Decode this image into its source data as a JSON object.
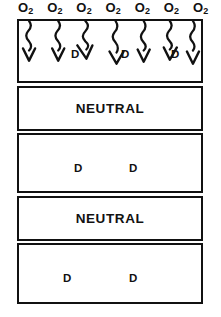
{
  "diagram": {
    "colors": {
      "ink": "#111111",
      "background": "#ffffff"
    },
    "top_species": {
      "symbol": "O",
      "subscript": "2",
      "count": 7,
      "labels": [
        "O",
        "O",
        "O",
        "O",
        "O",
        "O",
        "O"
      ],
      "subscripts": [
        "2",
        "2",
        "2",
        "2",
        "2",
        "2",
        "2"
      ]
    },
    "arrows": {
      "count": 7,
      "style": "wavy-down-arrow",
      "direction": "down"
    },
    "bands": [
      {
        "index": 1,
        "kind": "marker",
        "markers": [
          "D",
          "D",
          "D"
        ],
        "has_arrows": true
      },
      {
        "index": 2,
        "kind": "word",
        "word": "NEUTRAL",
        "markers": [],
        "has_arrows": false
      },
      {
        "index": 3,
        "kind": "marker",
        "markers": [
          "D",
          "D"
        ],
        "has_arrows": false
      },
      {
        "index": 4,
        "kind": "word",
        "word": "NEUTRAL",
        "markers": [],
        "has_arrows": false
      },
      {
        "index": 5,
        "kind": "marker",
        "markers": [
          "D",
          "D"
        ],
        "has_arrows": false
      }
    ]
  }
}
